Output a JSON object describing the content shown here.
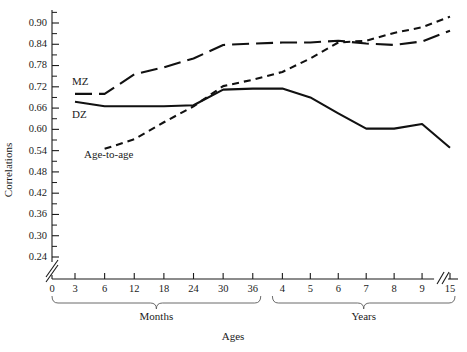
{
  "chart_data": {
    "type": "line",
    "title": "",
    "xlabel": "Ages",
    "ylabel": "Correlations",
    "grid": false,
    "legend": "inline-labels",
    "ylim": [
      0.21,
      0.93
    ],
    "y_ticks": [
      "0.90",
      "0.84",
      "0.78",
      "0.72",
      "0.66",
      "0.60",
      "0.54",
      "0.48",
      "0.42",
      "0.36",
      "0.30",
      "0.24"
    ],
    "y_tick_values": [
      0.9,
      0.84,
      0.78,
      0.72,
      0.66,
      0.6,
      0.54,
      0.48,
      0.42,
      0.36,
      0.3,
      0.24
    ],
    "y_minor_step": 0.03,
    "y_axis_break": true,
    "x_axis_break": true,
    "x_origin_label": "0",
    "x_groups": [
      {
        "name": "Months",
        "ticks": [
          "3",
          "6",
          "12",
          "18",
          "24",
          "30",
          "36"
        ]
      },
      {
        "name": "Years",
        "ticks": [
          "4",
          "5",
          "6",
          "7",
          "8",
          "9",
          "15"
        ]
      }
    ],
    "series": [
      {
        "name": "MZ",
        "style": "long-dash",
        "label": "MZ",
        "points": [
          {
            "x": "3",
            "y": 0.7
          },
          {
            "x": "6",
            "y": 0.7
          },
          {
            "x": "12",
            "y": 0.755
          },
          {
            "x": "18",
            "y": 0.775
          },
          {
            "x": "24",
            "y": 0.8
          },
          {
            "x": "30",
            "y": 0.838
          },
          {
            "x": "36",
            "y": 0.842
          },
          {
            "x": "4",
            "y": 0.845
          },
          {
            "x": "5",
            "y": 0.845
          },
          {
            "x": "6y",
            "y": 0.85
          },
          {
            "x": "7",
            "y": 0.842
          },
          {
            "x": "8",
            "y": 0.838
          },
          {
            "x": "9",
            "y": 0.848
          },
          {
            "x": "15",
            "y": 0.878
          }
        ]
      },
      {
        "name": "DZ",
        "style": "solid",
        "label": "DZ",
        "points": [
          {
            "x": "3",
            "y": 0.678
          },
          {
            "x": "6",
            "y": 0.665
          },
          {
            "x": "12",
            "y": 0.665
          },
          {
            "x": "18",
            "y": 0.665
          },
          {
            "x": "24",
            "y": 0.668
          },
          {
            "x": "30",
            "y": 0.712
          },
          {
            "x": "36",
            "y": 0.715
          },
          {
            "x": "4",
            "y": 0.715
          },
          {
            "x": "5",
            "y": 0.69
          },
          {
            "x": "6y",
            "y": 0.645
          },
          {
            "x": "7",
            "y": 0.602
          },
          {
            "x": "8",
            "y": 0.602
          },
          {
            "x": "9",
            "y": 0.615
          },
          {
            "x": "15",
            "y": 0.548
          }
        ]
      },
      {
        "name": "Age-to-age",
        "style": "short-dash",
        "label": "Age-to-age",
        "points": [
          {
            "x": "6",
            "y": 0.545
          },
          {
            "x": "12",
            "y": 0.572
          },
          {
            "x": "18",
            "y": 0.62
          },
          {
            "x": "24",
            "y": 0.665
          },
          {
            "x": "30",
            "y": 0.722
          },
          {
            "x": "36",
            "y": 0.74
          },
          {
            "x": "4",
            "y": 0.762
          },
          {
            "x": "5",
            "y": 0.8
          },
          {
            "x": "6y",
            "y": 0.845
          },
          {
            "x": "7",
            "y": 0.85
          },
          {
            "x": "8",
            "y": 0.872
          },
          {
            "x": "9",
            "y": 0.888
          },
          {
            "x": "15",
            "y": 0.918
          }
        ]
      }
    ]
  },
  "colors": {
    "line": "#111111",
    "axis": "#1a1a1a",
    "brace": "#5a5a5a",
    "background": "#ffffff"
  }
}
